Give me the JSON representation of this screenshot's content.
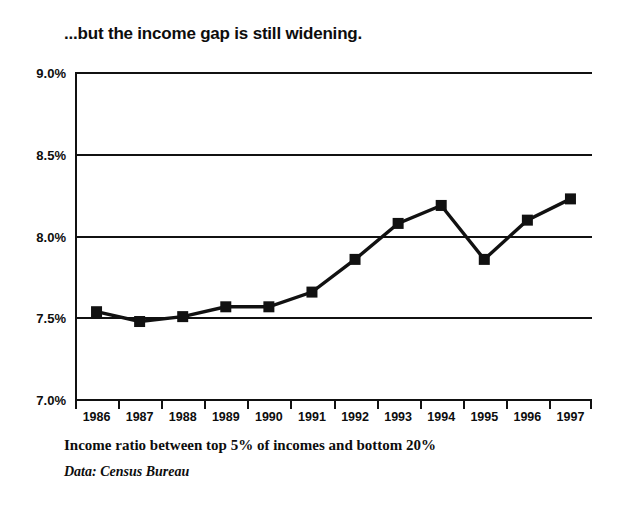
{
  "chart_data": {
    "type": "line",
    "title": "...but the income gap is still widening.",
    "xlabel": "",
    "ylabel": "",
    "categories": [
      "1986",
      "1987",
      "1988",
      "1989",
      "1990",
      "1991",
      "1992",
      "1993",
      "1994",
      "1995",
      "1996",
      "1997"
    ],
    "values": [
      7.54,
      7.48,
      7.51,
      7.57,
      7.57,
      7.66,
      7.86,
      8.08,
      8.19,
      7.86,
      8.1,
      8.23
    ],
    "series": [
      {
        "name": "Income ratio between top 5% of incomes and bottom 20%",
        "values": [
          7.54,
          7.48,
          7.51,
          7.57,
          7.57,
          7.66,
          7.86,
          8.08,
          8.19,
          7.86,
          8.1,
          8.23
        ]
      }
    ],
    "ylim": [
      7.0,
      9.0
    ],
    "yticks": [
      7.0,
      7.5,
      8.0,
      8.5,
      9.0
    ],
    "ytick_labels": [
      "7.0%",
      "7.5%",
      "8.0%",
      "8.5%",
      "9.0%"
    ],
    "grid": true,
    "legend": false,
    "legend_position": "none",
    "marker": "square",
    "line_color": "#111111",
    "marker_color": "#111111",
    "background_color": "#ffffff"
  },
  "caption": {
    "axis_description": "Income ratio between top 5% of incomes and bottom 20%",
    "source": "Data: Census Bureau"
  }
}
